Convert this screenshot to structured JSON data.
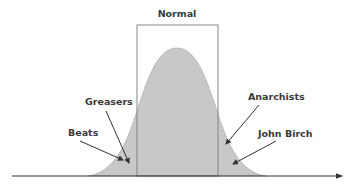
{
  "diagram": {
    "title": "Normal",
    "type": "normal-distribution",
    "labels": {
      "greasers": "Greasers",
      "beats": "Beats",
      "anarchists": "Anarchists",
      "john_birch": "John Birch"
    },
    "colors": {
      "curve_fill": "#c8c8c8",
      "curve_outline": "#8a8a8a",
      "rectangle_stroke": "#7a7a7a",
      "baseline": "#333333",
      "arrow": "#333333",
      "text": "#3a3a3a"
    }
  }
}
